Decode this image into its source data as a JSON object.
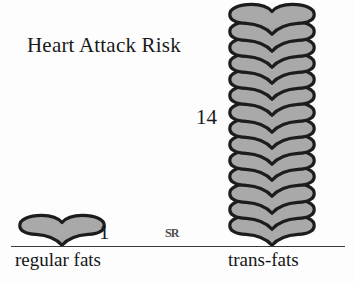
{
  "chart_data": {
    "type": "bar",
    "title": "Heart Attack Risk",
    "xlabel": "",
    "ylabel": "",
    "categories": [
      "regular fats",
      "trans-fats"
    ],
    "values": [
      1,
      14
    ],
    "value_labels": [
      "1",
      "14"
    ],
    "unit": "hearts",
    "glyph": "heart-icon",
    "grid": false,
    "legend": false,
    "ylim": [
      0,
      14
    ]
  },
  "watermark": {
    "text": "SR"
  },
  "colors": {
    "heart_fill": "#a9a9a9",
    "heart_outline": "#1c1c1c",
    "axis": "#3a3a3a",
    "text": "#1a1a1a",
    "background": "#fdfdfd"
  }
}
